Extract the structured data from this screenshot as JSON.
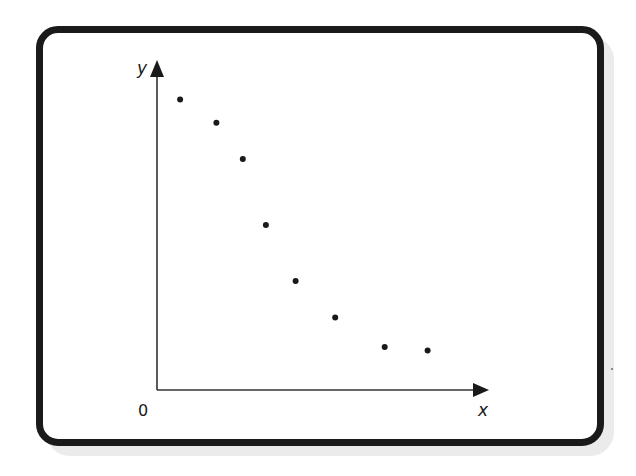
{
  "chart_data": {
    "type": "scatter",
    "title": "",
    "xlabel": "x",
    "ylabel": "y",
    "origin_label": "0",
    "grid": false,
    "legend": null,
    "ticks": {
      "x": [],
      "y": []
    },
    "note": "Unscaled axes; values are in relative units (x: 0-10 along axis, y: 0-10 along axis) estimated from pixel positions",
    "xlim": [
      0,
      10
    ],
    "ylim": [
      0,
      10
    ],
    "points": [
      {
        "x": 0.7,
        "y": 8.8
      },
      {
        "x": 1.8,
        "y": 8.1
      },
      {
        "x": 2.6,
        "y": 7.0
      },
      {
        "x": 3.3,
        "y": 5.0
      },
      {
        "x": 4.2,
        "y": 3.3
      },
      {
        "x": 5.4,
        "y": 2.2
      },
      {
        "x": 6.9,
        "y": 1.3
      },
      {
        "x": 8.2,
        "y": 1.2
      }
    ],
    "trend": "negative, decreasing curve flattening out at larger x"
  },
  "colors": {
    "frame": "#1a1a1a",
    "shadow": "#ebebeb",
    "points": "#1a1a1a",
    "axes": "#333333"
  }
}
